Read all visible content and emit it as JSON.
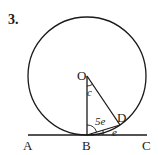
{
  "problem_number": "3.",
  "points": {
    "O": "O",
    "B": "B",
    "D": "D",
    "A": "A",
    "C": "C"
  },
  "angles": {
    "angle_at_O": "c",
    "angle_OBD": "5e",
    "angle_DBC": "e"
  },
  "colors": {
    "stroke": "#1a1a1a",
    "background": "#ffffff"
  }
}
